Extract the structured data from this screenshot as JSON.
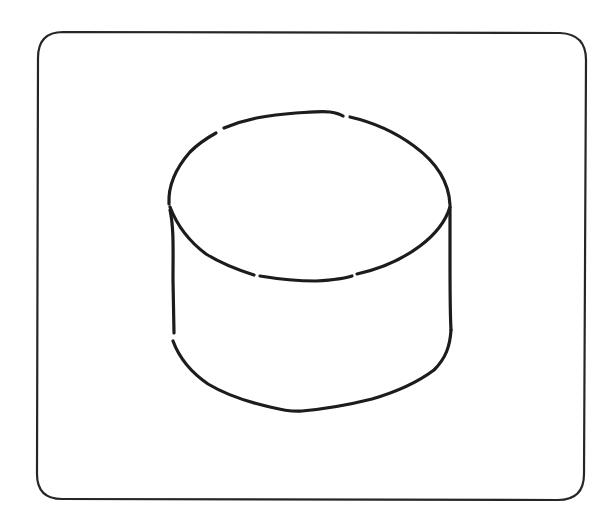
{
  "figure": {
    "description": "Hand-drawn cylinder inside a rounded square frame",
    "shape": "cylinder",
    "colors": {
      "background": "#ffffff",
      "stroke": "#1c1c1c",
      "frame_stroke": "#262626"
    },
    "frame": {
      "x": 37,
      "y": 32,
      "width": 548,
      "height": 468,
      "corner_radius": 26
    },
    "cylinder": {
      "top_ellipse_center": [
        310,
        196
      ],
      "top_ellipse_rx": 141,
      "top_ellipse_ry": 84,
      "left_x": 169,
      "right_x": 450,
      "side_top_y": 205,
      "side_bottom_y": 335,
      "bottom_lowest_point": [
        300,
        412
      ]
    }
  }
}
